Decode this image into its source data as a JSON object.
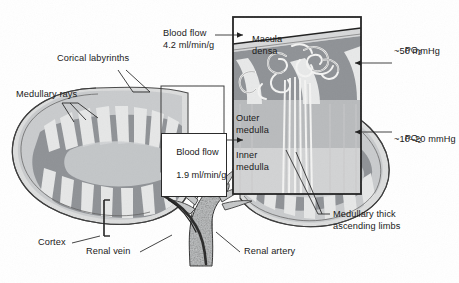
{
  "figure": {
    "background_color": "#ffffff",
    "width": 459,
    "height": 283
  },
  "palette": {
    "outline": "#2b2b2b",
    "cortex_band": "#c9cbcd",
    "medulla_fill": "#8f9296",
    "ray_light": "#e3e4e5",
    "capsule_light": "#d8d9da",
    "vessel_fill": "#c2c4c6",
    "vessel_dark": "#3a3a3a",
    "tubule_white": "#f2f2f1",
    "text": "#1a1a1a",
    "inset_border": "#222222"
  },
  "labels": {
    "cortical_labyrinths": "Corical labyrinths",
    "medullary_rays": "Medullary rays",
    "cortex": "Cortex",
    "renal_vein": "Renal vein",
    "renal_artery": "Renal artery",
    "macula_densa": "Macula\ndensa",
    "outer_medulla": "Outer\nmedulla",
    "inner_medulla": "Inner\nmedulla",
    "medullary_thick_ascending_limbs": "Medullary thick\nascending limbs"
  },
  "callouts": {
    "blood_flow_cortex": {
      "name": "blood-flow-cortex",
      "line1": "Blood flow",
      "line2": "4.2 ml/min/g",
      "boxed": false
    },
    "blood_flow_medulla": {
      "name": "blood-flow-medulla",
      "line1": "Blood flow",
      "line2": "1.9 ml/min/g",
      "boxed": true
    },
    "po2_cortex": {
      "name": "po2-cortex",
      "symbol": "PO",
      "subscript": "2",
      "value": "~50 mmHg"
    },
    "po2_medulla": {
      "name": "po2-medulla",
      "symbol": "PO",
      "subscript": "2",
      "value": "~10–20 mmHg"
    }
  },
  "regions": {
    "zoom_source_rect": {
      "x": 161,
      "y": 86,
      "width": 63,
      "height": 86
    },
    "inset_panel": {
      "x": 232,
      "y": 16,
      "width": 130,
      "height": 179
    }
  }
}
